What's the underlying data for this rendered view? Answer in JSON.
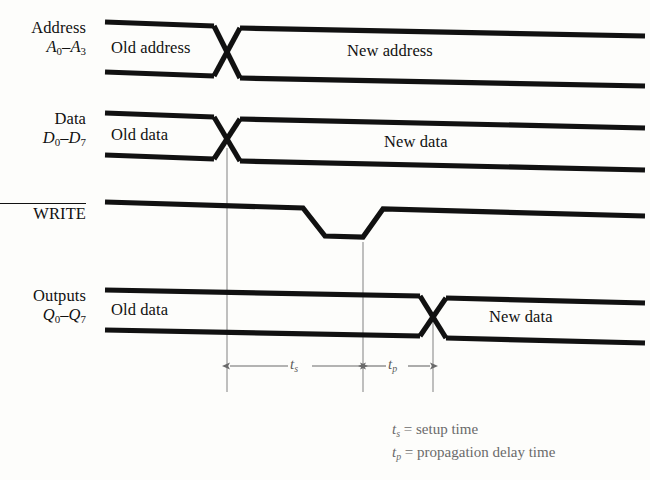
{
  "figure": {
    "type": "timing-diagram",
    "background_color": "#fdfdfb",
    "waveform_color": "#111111",
    "reference_line_color": "#8c8c8c",
    "arrow_color": "#6a6a6a"
  },
  "signals": [
    {
      "id": "address",
      "name": "Address",
      "range": "A",
      "range_sub_from": "0",
      "range_sub_to": "3",
      "style": "bus",
      "segments": [
        {
          "label": "Old address",
          "state": "valid"
        },
        {
          "label": "New address",
          "state": "valid"
        }
      ],
      "transition_x": 227
    },
    {
      "id": "data",
      "name": "Data",
      "range": "D",
      "range_sub_from": "0",
      "range_sub_to": "7",
      "style": "bus",
      "segments": [
        {
          "label": "Old data",
          "state": "valid"
        },
        {
          "label": "New data",
          "state": "valid"
        }
      ],
      "transition_x": 227
    },
    {
      "id": "write",
      "name": "WRITE",
      "active_low": true,
      "style": "single",
      "segments": [
        {
          "label": "",
          "state": "high"
        },
        {
          "label": "",
          "state": "low"
        },
        {
          "label": "",
          "state": "high"
        }
      ],
      "pulse_start_x": 303,
      "pulse_end_x": 363
    },
    {
      "id": "outputs",
      "name": "Outputs",
      "range": "Q",
      "range_sub_from": "0",
      "range_sub_to": "7",
      "style": "bus",
      "segments": [
        {
          "label": "Old data",
          "state": "valid"
        },
        {
          "label": "New data",
          "state": "valid"
        }
      ],
      "transition_x": 433
    }
  ],
  "measurements": [
    {
      "id": "t-setup",
      "symbol": "t",
      "subscript": "s",
      "from_x": 227,
      "to_x": 363,
      "description": "setup time"
    },
    {
      "id": "t-prop",
      "symbol": "t",
      "subscript": "p",
      "from_x": 363,
      "to_x": 433,
      "description": "propagation delay time"
    }
  ],
  "legend": [
    {
      "symbol": "t",
      "subscript": "s",
      "equals": "=",
      "text": "setup time"
    },
    {
      "symbol": "t",
      "subscript": "p",
      "equals": "=",
      "text": "propagation delay time"
    }
  ],
  "reference_lines": [
    227,
    363,
    433
  ]
}
